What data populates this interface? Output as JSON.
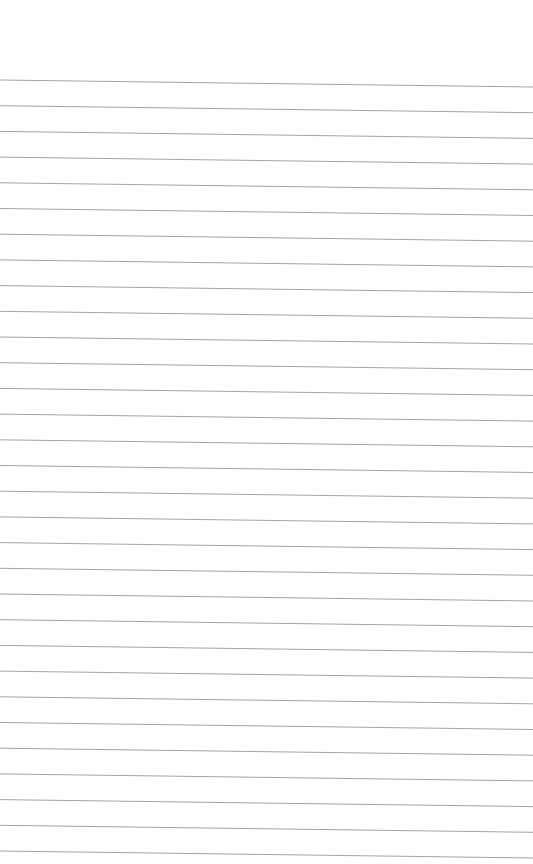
{
  "page": {
    "type": "lined-paper",
    "background": "#ffffff",
    "line_color": "#9a9a9a",
    "line_count": 31,
    "first_line_y": 80,
    "line_spacing": 25.7,
    "tilt_px": 7
  }
}
